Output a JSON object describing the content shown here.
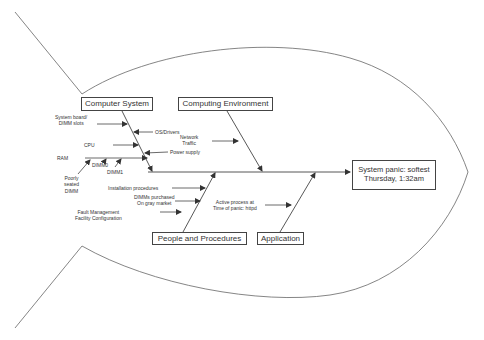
{
  "diagram": {
    "type": "fishbone (Ishikawa) cause-and-effect",
    "effect": {
      "line1": "System panic: softest",
      "line2": "Thursday, 1:32am"
    },
    "categories": {
      "computer_system": {
        "title": "Computer System",
        "causes": {
          "system_board": "System board/\nDIMM slots",
          "os_drivers": "OS/Drivers",
          "cpu": "CPU",
          "power_supply": "Power supply",
          "ram": "RAM",
          "dimm0": "DIMM0",
          "dimm1": "DIMM1",
          "poorly_seated": "Poorly\nseated\nDIMM"
        }
      },
      "computing_environment": {
        "title": "Computing Environment",
        "causes": {
          "network_traffic": "Network\nTraffic"
        }
      },
      "people_procedures": {
        "title": "People and Procedures",
        "causes": {
          "installation": "Installation procedures",
          "gray_market": "DIMMs purchased\nOn gray market",
          "fault_mgmt": "Fault Management\nFacility Configuration"
        }
      },
      "application": {
        "title": "Application",
        "causes": {
          "active_process": "Active process at\nTime of panic: httpd"
        }
      }
    },
    "colors": {
      "line": "#444444",
      "outline": "#555555",
      "text": "#333333",
      "background": "#ffffff"
    }
  }
}
